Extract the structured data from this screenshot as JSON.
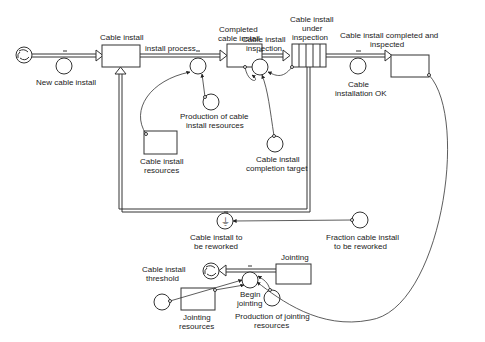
{
  "diagram": {
    "type": "stock-and-flow",
    "stocks": {
      "cable_install": "Cable install",
      "completed_cable_install": "Completed cable install",
      "cable_install_under_inspection_1": "Cable install",
      "cable_install_under_inspection_2": "under",
      "cable_install_under_inspection_3": "inspection",
      "completed_and_inspected_1": "Cable install completed and",
      "completed_and_inspected_2": "inspected",
      "cable_install_resources_1": "Cable install",
      "cable_install_resources_2": "resources",
      "jointing": "Jointing",
      "jointing_resources_1": "Jointing",
      "jointing_resources_2": "resources"
    },
    "flows": {
      "new_cable_install": "New cable install",
      "install_process": "install process",
      "cable_install_inspection_1": "Cable install",
      "cable_install_inspection_2": "inspection",
      "cable_installation_ok_1": "Cable",
      "cable_installation_ok_2": "installation OK",
      "cable_install_to_be_reworked_1": "Cable install to",
      "cable_install_to_be_reworked_2": "be reworked",
      "begin_jointing_1": "Begin",
      "begin_jointing_2": "jointing"
    },
    "auxiliaries": {
      "production_cable_install_resources_1": "Production of cable",
      "production_cable_install_resources_2": "install resources",
      "completion_target_1": "Cable install",
      "completion_target_2": "completion target",
      "fraction_reworked_1": "Fraction cable install",
      "fraction_reworked_2": "to be reworked",
      "cable_install_threshold_1": "Cable install",
      "cable_install_threshold_2": "threshold",
      "production_jointing_resources_1": "Production of jointing",
      "production_jointing_resources_2": "resources"
    },
    "completed_label_1": "Completed",
    "completed_label_2": "cable install"
  },
  "colors": {
    "line": "#333333",
    "background": "#ffffff"
  }
}
